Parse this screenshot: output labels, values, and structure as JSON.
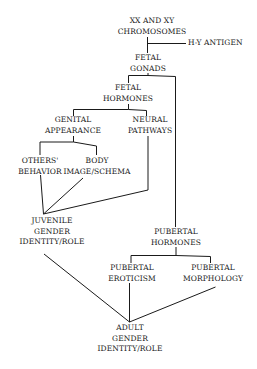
{
  "diagram": {
    "line_color": "#1a1a1a",
    "background": "#ffffff",
    "nodes": {
      "chromosomes": {
        "line1": "XX AND XY",
        "line2": "CHROMOSOMES"
      },
      "hy_antigen": {
        "line1": "H-Y ANTIGEN"
      },
      "fetal_gonads": {
        "line1": "FETAL",
        "line2": "GONADS"
      },
      "fetal_hormones": {
        "line1": "FETAL",
        "line2": "HORMONES"
      },
      "genital_appearance": {
        "line1": "GENITAL",
        "line2": "APPEARANCE"
      },
      "neural_pathways": {
        "line1": "NEURAL",
        "line2": "PATHWAYS"
      },
      "others_behavior": {
        "line1": "OTHERS'",
        "line2": "BEHAVIOR"
      },
      "body_image": {
        "line1": "BODY",
        "line2": "IMAGE/SCHEMA"
      },
      "juvenile_identity": {
        "line1": "JUVENILE",
        "line2": "GENDER",
        "line3": "IDENTITY/ROLE"
      },
      "pubertal_hormones": {
        "line1": "PUBERTAL",
        "line2": "HORMONES"
      },
      "pubertal_eroticism": {
        "line1": "PUBERTAL",
        "line2": "EROTICISM"
      },
      "pubertal_morphology": {
        "line1": "PUBERTAL",
        "line2": "MORPHOLOGY"
      },
      "adult_identity": {
        "line1": "ADULT",
        "line2": "GENDER",
        "line3": "IDENTITY/ROLE"
      }
    },
    "edges": [
      [
        "chromosomes",
        "fetal_gonads"
      ],
      [
        "hy_antigen",
        "chromosomes-fetal_gonads-edge"
      ],
      [
        "fetal_gonads",
        "fetal_hormones"
      ],
      [
        "fetal_gonads",
        "pubertal_hormones"
      ],
      [
        "fetal_hormones",
        "genital_appearance"
      ],
      [
        "fetal_hormones",
        "neural_pathways"
      ],
      [
        "genital_appearance",
        "others_behavior"
      ],
      [
        "genital_appearance",
        "body_image"
      ],
      [
        "others_behavior",
        "juvenile_identity"
      ],
      [
        "body_image",
        "juvenile_identity"
      ],
      [
        "neural_pathways",
        "juvenile_identity"
      ],
      [
        "juvenile_identity",
        "adult_identity"
      ],
      [
        "pubertal_hormones",
        "pubertal_eroticism"
      ],
      [
        "pubertal_hormones",
        "pubertal_morphology"
      ],
      [
        "pubertal_eroticism",
        "adult_identity"
      ],
      [
        "pubertal_morphology",
        "adult_identity"
      ]
    ]
  }
}
